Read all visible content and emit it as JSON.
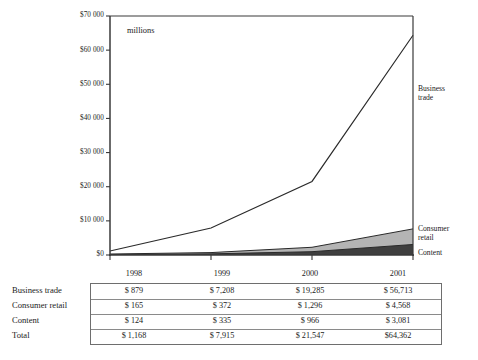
{
  "chart_data": {
    "type": "area",
    "title": "",
    "subtitle": "",
    "units_note": "millions",
    "xlabel": "",
    "ylabel": "",
    "categories": [
      "1998",
      "1999",
      "2000",
      "2001"
    ],
    "x": [
      1998,
      1999,
      2000,
      2001
    ],
    "ylim": [
      0,
      70000
    ],
    "xlim": [
      1998,
      2001
    ],
    "grid": false,
    "stacked": true,
    "legend_position": "right-inline",
    "y_ticks": [
      0,
      10000,
      20000,
      30000,
      40000,
      50000,
      60000,
      70000
    ],
    "y_tick_labels": [
      "$0",
      "$10 000",
      "$20 000",
      "$30 000",
      "$40 000",
      "$50 000",
      "$60 000",
      "$70 000"
    ],
    "series": [
      {
        "name": "Content",
        "label": "Content",
        "color": "#3f3f3f",
        "values": [
          124,
          335,
          966,
          3081
        ]
      },
      {
        "name": "Consumer retail",
        "label": "Consumer retail",
        "color": "#b4b4b4",
        "values": [
          165,
          372,
          1296,
          4568
        ]
      },
      {
        "name": "Business trade",
        "label": "Business trade",
        "color": "#ffffff",
        "values": [
          879,
          7208,
          19285,
          56713
        ]
      }
    ],
    "totals": [
      1168,
      7915,
      21547,
      64362
    ],
    "annotations": [
      {
        "name": "business-trade",
        "text_line1": "Business",
        "text_line2": "trade"
      },
      {
        "name": "consumer-retail",
        "text_line1": "Consumer",
        "text_line2": "retail"
      },
      {
        "name": "content",
        "text_line1": "Content",
        "text_line2": ""
      }
    ]
  },
  "table": {
    "corner_label": "",
    "column_headers": [
      "1998",
      "1999",
      "2000",
      "2001"
    ],
    "rows": [
      {
        "label": "Business trade",
        "cells": [
          "$ 879",
          "$ 7,208",
          "$ 19,285",
          "$ 56,713"
        ]
      },
      {
        "label": "Consumer retail",
        "cells": [
          "$ 165",
          "$ 372",
          "$ 1,296",
          "$ 4,568"
        ]
      },
      {
        "label": "Content",
        "cells": [
          "$ 124",
          "$ 335",
          "$ 966",
          "$ 3,081"
        ]
      },
      {
        "label": "Total",
        "cells": [
          "$ 1,168",
          "$ 7,915",
          "$ 21,547",
          "$64,362"
        ]
      }
    ]
  },
  "colors": {
    "axis": "#3a3a3a",
    "line": "#2a2a2a",
    "content_band": "#3f3f3f",
    "consumer_band": "#b4b4b4",
    "business_band": "#ffffff",
    "table_border": "#6e6e6e",
    "text": "#1b1b1b",
    "background": "#ffffff"
  }
}
